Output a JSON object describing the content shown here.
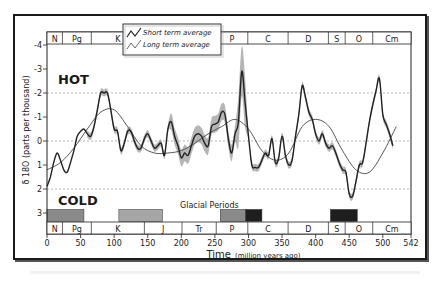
{
  "chart_data": {
    "type": "line",
    "title": "",
    "xlabel": "Time",
    "xlabel_units": "(million years ago)",
    "ylabel": "δ 18O (parts per thousand)",
    "xlim": [
      0,
      542
    ],
    "ylim": [
      -4,
      3
    ],
    "y_inverted": true,
    "x_ticks": [
      0,
      50,
      100,
      150,
      200,
      250,
      300,
      350,
      400,
      450,
      500,
      542
    ],
    "y_ticks": [
      -4,
      -3,
      -2,
      -1,
      0,
      1,
      2,
      3
    ],
    "gridlines_dashed_at": [
      -2,
      0,
      2
    ],
    "annotations": {
      "hot": "HOT",
      "cold": "COLD",
      "glacial_title": "Glacial Periods"
    },
    "legend": {
      "position": "upper-left-center",
      "entries": [
        "Short term average",
        "Long term average"
      ]
    },
    "geologic_periods": [
      {
        "label": "N",
        "start": 0,
        "end": 23
      },
      {
        "label": "Pg",
        "start": 23,
        "end": 66
      },
      {
        "label": "K",
        "start": 66,
        "end": 145
      },
      {
        "label": "J",
        "start": 145,
        "end": 201
      },
      {
        "label": "Tr",
        "start": 201,
        "end": 252
      },
      {
        "label": "P",
        "start": 252,
        "end": 299
      },
      {
        "label": "C",
        "start": 299,
        "end": 359
      },
      {
        "label": "D",
        "start": 359,
        "end": 419
      },
      {
        "label": "S",
        "start": 419,
        "end": 444
      },
      {
        "label": "O",
        "start": 444,
        "end": 485
      },
      {
        "label": "Cm",
        "start": 485,
        "end": 542
      }
    ],
    "glacial_periods": [
      {
        "start": 0,
        "end": 55,
        "shade": "medium"
      },
      {
        "start": 107,
        "end": 172,
        "shade": "light"
      },
      {
        "start": 258,
        "end": 296,
        "shade": "medium"
      },
      {
        "start": 296,
        "end": 320,
        "shade": "dark"
      },
      {
        "start": 422,
        "end": 462,
        "shade": "dark"
      }
    ],
    "series": [
      {
        "name": "Short term average",
        "x": [
          0,
          5,
          10,
          15,
          20,
          25,
          30,
          35,
          40,
          45,
          50,
          55,
          60,
          65,
          70,
          75,
          80,
          85,
          90,
          95,
          100,
          105,
          110,
          115,
          120,
          125,
          130,
          135,
          140,
          145,
          150,
          155,
          160,
          165,
          170,
          175,
          180,
          185,
          190,
          195,
          200,
          205,
          210,
          215,
          220,
          225,
          230,
          235,
          240,
          245,
          250,
          255,
          260,
          265,
          270,
          275,
          280,
          285,
          290,
          295,
          300,
          305,
          310,
          315,
          320,
          325,
          330,
          335,
          340,
          345,
          350,
          355,
          360,
          365,
          370,
          375,
          380,
          385,
          390,
          395,
          400,
          405,
          410,
          415,
          420,
          425,
          430,
          435,
          440,
          445,
          450,
          455,
          460,
          465,
          470,
          475,
          480,
          485,
          490,
          495,
          500,
          505,
          510,
          515
        ],
        "y": [
          1.9,
          1.5,
          0.9,
          0.5,
          0.8,
          1.2,
          1.3,
          0.9,
          0.4,
          -0.2,
          -0.4,
          -0.5,
          -0.3,
          -0.2,
          -0.6,
          -1.3,
          -2.0,
          -2.0,
          -2.0,
          -1.3,
          -0.5,
          -0.4,
          0.4,
          0.1,
          -0.4,
          -0.4,
          0.0,
          0.3,
          0.3,
          -0.1,
          -0.3,
          0.0,
          0.3,
          0.2,
          0.1,
          0.6,
          -0.5,
          -0.8,
          -0.2,
          0.2,
          0.7,
          0.5,
          0.6,
          0.2,
          -0.2,
          -0.3,
          -0.2,
          0.1,
          0.2,
          -0.6,
          -0.7,
          -0.8,
          -1.2,
          -1.1,
          -0.1,
          0.5,
          -0.3,
          -0.8,
          -2.9,
          -1.6,
          -0.2,
          1.0,
          1.1,
          1.1,
          0.8,
          0.5,
          0.6,
          -0.1,
          0.9,
          0.7,
          -0.2,
          0.6,
          1.0,
          0.8,
          -0.2,
          -1.1,
          -2.3,
          -1.8,
          -1.2,
          -0.9,
          -0.3,
          0.0,
          -0.3,
          0.1,
          0.3,
          0.2,
          0.5,
          0.9,
          1.2,
          1.3,
          2.2,
          2.3,
          1.7,
          1.0,
          0.9,
          0.1,
          -0.8,
          -1.5,
          -2.1,
          -2.6,
          -1.1,
          -0.7,
          -0.3,
          0.2
        ]
      },
      {
        "name": "Long term average",
        "x": [
          0,
          20,
          40,
          60,
          80,
          100,
          120,
          140,
          160,
          180,
          200,
          220,
          240,
          260,
          280,
          300,
          320,
          340,
          360,
          380,
          400,
          420,
          440,
          460,
          480,
          500,
          520
        ],
        "y": [
          1.2,
          0.9,
          0.3,
          -0.5,
          -1.2,
          -1.3,
          -0.6,
          0.2,
          0.5,
          0.5,
          0.4,
          0.1,
          -0.3,
          -0.6,
          -0.9,
          -0.5,
          0.4,
          0.8,
          0.5,
          -0.6,
          -0.9,
          -0.6,
          0.4,
          1.2,
          1.3,
          0.5,
          -0.6
        ]
      }
    ],
    "colors": {
      "short_term_line": "#222222",
      "long_term_line": "#555555",
      "uncertainty_band": "#a8a8a8",
      "glacial_light": "#a6a6a6",
      "glacial_medium": "#8a8a8a",
      "glacial_dark": "#1e1e1e",
      "frame": "#1a1a1a"
    }
  }
}
